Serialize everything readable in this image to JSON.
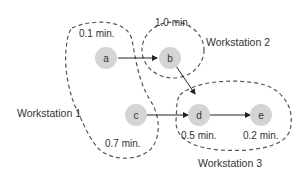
{
  "diagram": {
    "nodes": [
      {
        "id": "a",
        "label": "a",
        "time": "0.1 min."
      },
      {
        "id": "b",
        "label": "b",
        "time": "1.0 min."
      },
      {
        "id": "c",
        "label": "c",
        "time": "0.7 min."
      },
      {
        "id": "d",
        "label": "d",
        "time": "0.5 min."
      },
      {
        "id": "e",
        "label": "e",
        "time": "0.2 min."
      }
    ],
    "edges": [
      {
        "from": "a",
        "to": "b"
      },
      {
        "from": "b",
        "to": "d"
      },
      {
        "from": "c",
        "to": "d"
      },
      {
        "from": "d",
        "to": "e"
      }
    ],
    "workstations": [
      {
        "label": "Workstation 1",
        "nodes": [
          "a",
          "c"
        ]
      },
      {
        "label": "Workstation 2",
        "nodes": [
          "b"
        ]
      },
      {
        "label": "Workstation 3",
        "nodes": [
          "d",
          "e"
        ]
      }
    ],
    "colors": {
      "node_fill": "#d4d4d4",
      "line": "#333333",
      "dash": "#555555"
    }
  }
}
